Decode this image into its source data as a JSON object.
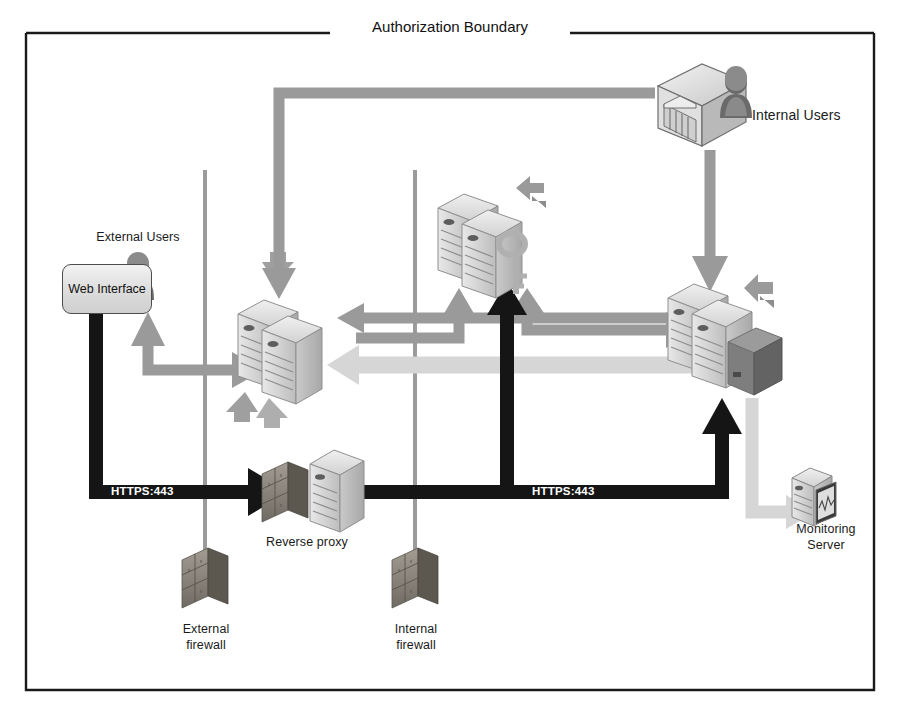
{
  "diagram": {
    "title": "Authorization Boundary",
    "type": "network-architecture-diagram",
    "background_color": "#ffffff",
    "boundary_border_color": "#1a1a1a"
  },
  "labels": {
    "authorization_boundary": "Authorization Boundary",
    "internal_users": "Internal Users",
    "external_users": "External Users",
    "web_interface": "Web Interface",
    "reverse_proxy": "Reverse proxy",
    "external_firewall": "External\nfirewall",
    "external_firewall_line1": "External",
    "external_firewall_line2": "firewall",
    "internal_firewall_line1": "Internal",
    "internal_firewall_line2": "firewall",
    "monitoring_server_line1": "Monitoring",
    "monitoring_server_line2": "Server",
    "https_left": "HTTPS:443",
    "https_right": "HTTPS:443"
  },
  "nodes": [
    {
      "id": "internal-users",
      "label": "Internal Users",
      "icon": "building-user-icon",
      "x": 700,
      "y": 105
    },
    {
      "id": "external-users",
      "label": "External Users",
      "icon": "user-icon",
      "x": 145,
      "y": 238
    },
    {
      "id": "web-interface",
      "label": "Web Interface",
      "icon": "rounded-box",
      "x": 106,
      "y": 288
    },
    {
      "id": "web-server-cluster",
      "label": "",
      "icon": "server-pair-icon",
      "x": 287,
      "y": 355
    },
    {
      "id": "app-server-cluster",
      "label": "",
      "icon": "server-pair-key-icon",
      "x": 487,
      "y": 245
    },
    {
      "id": "db-server-cluster",
      "label": "",
      "icon": "server-pair-storage-icon",
      "x": 718,
      "y": 335
    },
    {
      "id": "reverse-proxy",
      "label": "Reverse proxy",
      "icon": "server-brickwall-icon",
      "x": 310,
      "y": 490
    },
    {
      "id": "external-firewall",
      "label": "External firewall",
      "icon": "brick-firewall-icon",
      "x": 205,
      "y": 588
    },
    {
      "id": "internal-firewall",
      "label": "Internal firewall",
      "icon": "brick-firewall-icon",
      "x": 415,
      "y": 588
    },
    {
      "id": "monitoring-server",
      "label": "Monitoring Server",
      "icon": "monitoring-server-icon",
      "x": 820,
      "y": 495
    }
  ],
  "connections": [
    {
      "id": "internal-users-to-web-cluster",
      "style": "gray-thick",
      "label": ""
    },
    {
      "id": "internal-users-to-db-cluster",
      "style": "gray-thick",
      "label": ""
    },
    {
      "id": "web-interface-to-reverse-proxy",
      "style": "black-thick",
      "label": "HTTPS:443"
    },
    {
      "id": "reverse-proxy-to-db-cluster",
      "style": "black-thick",
      "label": "HTTPS:443"
    },
    {
      "id": "web-interface-bidirectional-web-cluster",
      "style": "gray-arrow",
      "label": ""
    },
    {
      "id": "db-cluster-to-web-cluster",
      "style": "light-gray-arrow",
      "label": ""
    },
    {
      "id": "web-cluster-to-app-cluster",
      "style": "gray-arrow",
      "label": ""
    },
    {
      "id": "app-cluster-to-db-cluster",
      "style": "gray-arrow",
      "label": ""
    },
    {
      "id": "db-cluster-to-monitoring-server",
      "style": "light-gray-arrow",
      "label": ""
    },
    {
      "id": "black-vertical-to-app-cluster",
      "style": "black-thick",
      "label": ""
    }
  ],
  "colors": {
    "gray_arrow": "#9a9a9a",
    "light_gray_arrow": "#d6d6d6",
    "black_arrow": "#151515",
    "firewall_line": "#9b9b9b",
    "server_body": "#cfcfcf",
    "server_top": "#e4e4e4",
    "text": "#1a1a1a"
  }
}
